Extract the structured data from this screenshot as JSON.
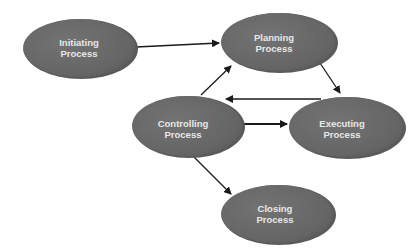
{
  "diagram": {
    "type": "process-flow",
    "colors": {
      "node_fill": "#6b6b6b",
      "node_edge": "#585858",
      "node_highlight": "#7a7a7a",
      "label": "#e8e8e8",
      "arrow": "#1a1a1a",
      "background": "#ffffff"
    },
    "nodes": [
      {
        "id": "initiating",
        "line1": "Initiating",
        "line2": "Process",
        "cx": 79,
        "cy": 48,
        "rx": 57,
        "ry": 30
      },
      {
        "id": "planning",
        "line1": "Planning",
        "line2": "Process",
        "cx": 278,
        "cy": 42,
        "rx": 58,
        "ry": 30
      },
      {
        "id": "controlling",
        "line1": "Controlling",
        "line2": "Process",
        "cx": 187,
        "cy": 126,
        "rx": 56,
        "ry": 31
      },
      {
        "id": "executing",
        "line1": "Executing",
        "line2": "Process",
        "cx": 346,
        "cy": 127,
        "rx": 58,
        "ry": 31
      },
      {
        "id": "closing",
        "line1": "Closing",
        "line2": "Process",
        "cx": 277,
        "cy": 214,
        "rx": 57,
        "ry": 30
      }
    ],
    "edges": [
      {
        "from": "initiating",
        "to": "planning"
      },
      {
        "from": "planning",
        "to": "executing"
      },
      {
        "from": "executing",
        "to": "controlling"
      },
      {
        "from": "controlling",
        "to": "executing"
      },
      {
        "from": "controlling",
        "to": "planning"
      },
      {
        "from": "controlling",
        "to": "closing"
      }
    ]
  }
}
